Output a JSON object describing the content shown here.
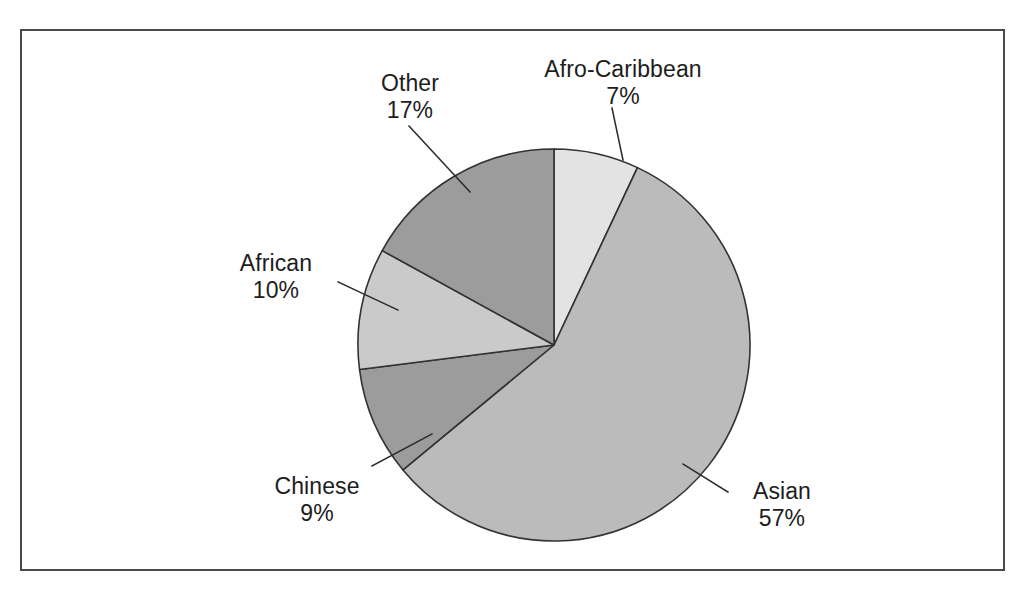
{
  "figure": {
    "background_color": "#ffffff",
    "frame_color": "#4a4a4a",
    "has_frame": true,
    "has_title": false
  },
  "chart_data": {
    "type": "pie",
    "title": "",
    "subtitle": "",
    "xlabel": "",
    "ylabel": "",
    "grid": false,
    "legend": "none",
    "label_format": "name above percentage, connected by leader lines",
    "start_angle_deg": 0,
    "direction": "clockwise",
    "center_px": [
      554,
      345
    ],
    "radius_px": 196,
    "categories": [
      "Afro-Caribbean",
      "Asian",
      "Chinese",
      "African",
      "Other"
    ],
    "values": [
      7,
      57,
      9,
      10,
      17
    ],
    "value_unit": "%",
    "total": 100,
    "slices": [
      {
        "label": "Afro-Caribbean",
        "value": 7,
        "value_text": "7%",
        "color": "#e3e3e3",
        "start_deg": 0,
        "end_deg": 25.2
      },
      {
        "label": "Asian",
        "value": 57,
        "value_text": "57%",
        "color": "#bbbbbb",
        "start_deg": 25.2,
        "end_deg": 230.4
      },
      {
        "label": "Chinese",
        "value": 9,
        "value_text": "9%",
        "color": "#9c9c9c",
        "start_deg": 230.4,
        "end_deg": 262.8
      },
      {
        "label": "African",
        "value": 10,
        "value_text": "10%",
        "color": "#cacaca",
        "start_deg": 262.8,
        "end_deg": 298.8
      },
      {
        "label": "Other",
        "value": 17,
        "value_text": "17%",
        "color": "#9c9c9c",
        "start_deg": 298.8,
        "end_deg": 360
      }
    ]
  },
  "labels": {
    "afro": {
      "name": "Afro-Caribbean",
      "value": "7%"
    },
    "asian": {
      "name": "Asian",
      "value": "57%"
    },
    "chinese": {
      "name": "Chinese",
      "value": "9%"
    },
    "african": {
      "name": "African",
      "value": "10%"
    },
    "other": {
      "name": "Other",
      "value": "17%"
    }
  }
}
